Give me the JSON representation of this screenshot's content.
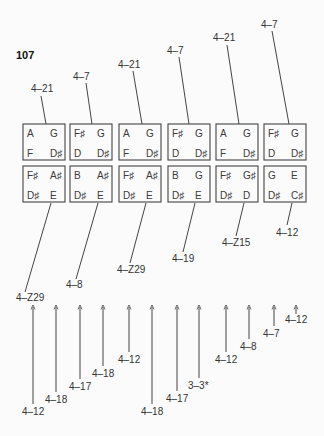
{
  "figure": {
    "number": "107"
  },
  "top_row": [
    {
      "label": "4–21",
      "notes": [
        "A",
        "G",
        "F",
        "D♯"
      ]
    },
    {
      "label": "4–7",
      "notes": [
        "F♯",
        "G",
        "D",
        "D♯"
      ]
    },
    {
      "label": "4–21",
      "notes": [
        "A",
        "G",
        "F",
        "D♯"
      ]
    },
    {
      "label": "4–7",
      "notes": [
        "F♯",
        "G",
        "D",
        "D♯"
      ]
    },
    {
      "label": "4–21",
      "notes": [
        "A",
        "G",
        "F",
        "D♯"
      ]
    },
    {
      "label": "4–7",
      "notes": [
        "F♯",
        "G",
        "D",
        "D♯"
      ]
    }
  ],
  "bottom_row": [
    {
      "label": "4–Z29",
      "notes": [
        "F♯",
        "A♯",
        "D♯",
        "E"
      ]
    },
    {
      "label": "4–8",
      "notes": [
        "B",
        "A♯",
        "D♯",
        "E"
      ]
    },
    {
      "label": "4–Z29",
      "notes": [
        "F♯",
        "A♯",
        "D♯",
        "E"
      ]
    },
    {
      "label": "4–19",
      "notes": [
        "B",
        "G",
        "D♯",
        "E"
      ]
    },
    {
      "label": "4–Z15",
      "notes": [
        "F♯",
        "G♯",
        "D♯",
        "D"
      ]
    },
    {
      "label": "4–12",
      "notes": [
        "G",
        "E",
        "D♯",
        "C♯"
      ]
    }
  ],
  "arrows": [
    {
      "label": "4–12"
    },
    {
      "label": "4–18"
    },
    {
      "label": "4–17"
    },
    {
      "label": "4–18"
    },
    {
      "label": "4–12"
    },
    {
      "label": "4–18"
    },
    {
      "label": "4–17"
    },
    {
      "label": "3–3*"
    },
    {
      "label": "4–12"
    },
    {
      "label": "4–8"
    },
    {
      "label": "4–7"
    },
    {
      "label": "4–12"
    }
  ]
}
